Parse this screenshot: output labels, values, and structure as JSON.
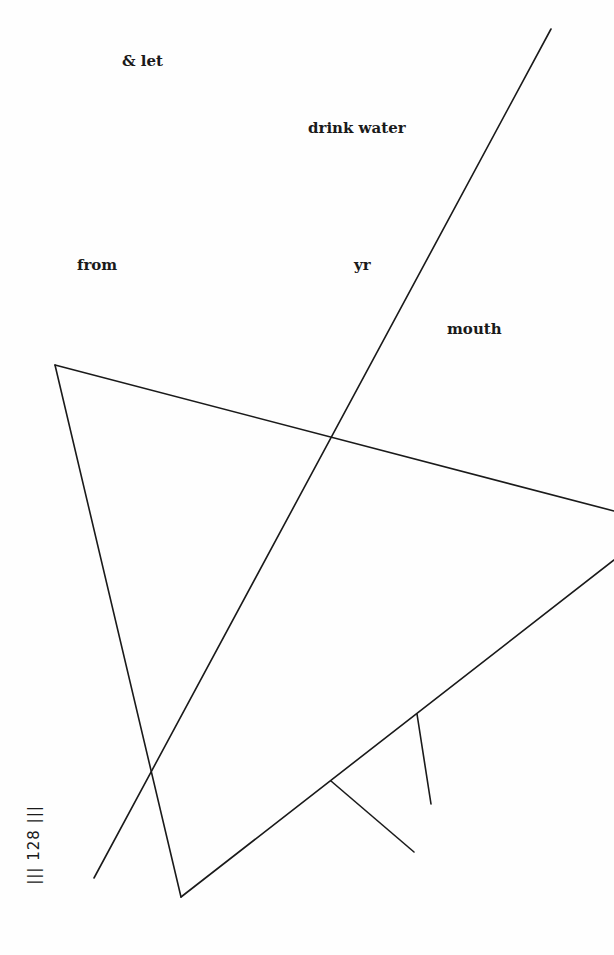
{
  "poem": {
    "words": [
      {
        "text": "& let",
        "x": 122,
        "y": 54
      },
      {
        "text": "drink water",
        "x": 308,
        "y": 121
      },
      {
        "text": "from",
        "x": 77,
        "y": 258
      },
      {
        "text": "yr",
        "x": 354,
        "y": 258
      },
      {
        "text": "mouth",
        "x": 447,
        "y": 322
      }
    ]
  },
  "page_number": {
    "text": "||| 128 |||"
  },
  "drawing": {
    "stroke_color": "#1a1a1a",
    "lines": [
      {
        "name": "long-diagonal",
        "x1": 551,
        "y1": 29,
        "x2": 94,
        "y2": 878
      },
      {
        "name": "upper-edge",
        "x1": 55,
        "y1": 365,
        "x2": 614,
        "y2": 511
      },
      {
        "name": "left-edge",
        "x1": 55,
        "y1": 365,
        "x2": 181,
        "y2": 897
      },
      {
        "name": "lower-edge",
        "x1": 181,
        "y1": 897,
        "x2": 614,
        "y2": 560
      },
      {
        "name": "branch-left",
        "x1": 331,
        "y1": 781,
        "x2": 414,
        "y2": 852
      },
      {
        "name": "branch-right",
        "x1": 417,
        "y1": 714,
        "x2": 431,
        "y2": 804
      }
    ]
  }
}
